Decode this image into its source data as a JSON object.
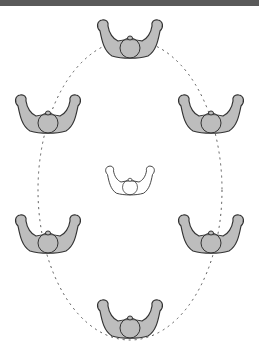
{
  "header": {
    "title": "",
    "background": "#5a5a5a"
  },
  "diagram": {
    "path": {
      "style": "dashed",
      "shape": "ellipse",
      "cx": 130,
      "cy": 190,
      "rx": 92,
      "ry": 150,
      "color": "#555555"
    },
    "figures": [
      {
        "id": "top",
        "x": 130,
        "y": 45,
        "fill": "#bdbdbd"
      },
      {
        "id": "upper-left",
        "x": 48,
        "y": 120,
        "fill": "#bdbdbd"
      },
      {
        "id": "upper-right",
        "x": 211,
        "y": 120,
        "fill": "#bdbdbd"
      },
      {
        "id": "center",
        "x": 130,
        "y": 185,
        "fill": "#ffffff"
      },
      {
        "id": "lower-left",
        "x": 48,
        "y": 240,
        "fill": "#bdbdbd"
      },
      {
        "id": "lower-right",
        "x": 211,
        "y": 240,
        "fill": "#bdbdbd"
      },
      {
        "id": "bottom",
        "x": 130,
        "y": 325,
        "fill": "#bdbdbd"
      }
    ],
    "stroke": "#333333"
  }
}
